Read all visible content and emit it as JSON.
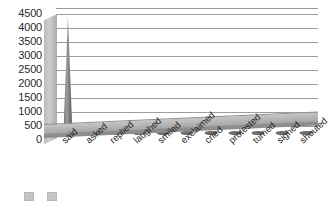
{
  "chart_data": {
    "type": "bar",
    "title": "",
    "subtitle": "",
    "xlabel": "",
    "ylabel": "",
    "categories": [
      "said",
      "asked",
      "replied",
      "laughed",
      "smiled",
      "exclaimed",
      "cried",
      "protested",
      "turned",
      "sighed",
      "shouted"
    ],
    "values": [
      4200,
      310,
      270,
      190,
      140,
      90,
      60,
      45,
      35,
      30,
      25
    ],
    "series": [
      {
        "name": "Frequency",
        "values": [
          4200,
          310,
          270,
          190,
          140,
          90,
          60,
          45,
          35,
          30,
          25
        ]
      }
    ],
    "ylim": [
      0,
      4500
    ],
    "y_ticks": [
      4500,
      4000,
      3500,
      3000,
      2500,
      2000,
      1500,
      1000,
      500,
      0
    ],
    "y_tick_labels": [
      "4500",
      "4000",
      "3500",
      "3000",
      "2500",
      "2000",
      "1500",
      "1000",
      "500",
      "0"
    ],
    "grid": true,
    "grid_axis": "y",
    "legend_position": "bottom",
    "style": "3d-cone",
    "bar_color": "#7d7d7d",
    "grid_color": "#9d9d9d",
    "floor_color": "#b0b0b0",
    "text_color": "#1f1f1f"
  },
  "legend": {
    "items": [
      {
        "label": ""
      },
      {
        "label": ""
      }
    ]
  }
}
